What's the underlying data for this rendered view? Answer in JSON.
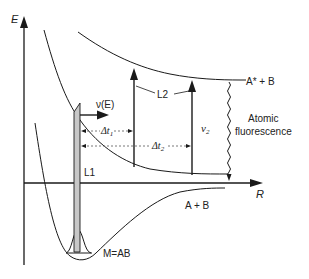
{
  "diagram": {
    "axes": {
      "y_label": "E",
      "x_label": "R"
    },
    "curves": {
      "upper_state_label": "A* + B",
      "ground_dissociation_label": "A + B",
      "molecule_label": "M=AB"
    },
    "lasers": {
      "pump_label": "L1",
      "probe_label": "L2",
      "frequency_label": "ν(E)",
      "probe_frequency_label": "ν",
      "probe_frequency_sub": "2"
    },
    "delays": {
      "delay1_main": "Δt",
      "delay1_sub": "1",
      "delay2_main": "Δt",
      "delay2_sub": "2"
    },
    "emission": {
      "label_line1": "Atomic",
      "label_line2": "fluorescence"
    },
    "colors": {
      "line": "#1a1a1a",
      "bar_fill": "#c8c8c8",
      "dashed": "#555555"
    }
  }
}
